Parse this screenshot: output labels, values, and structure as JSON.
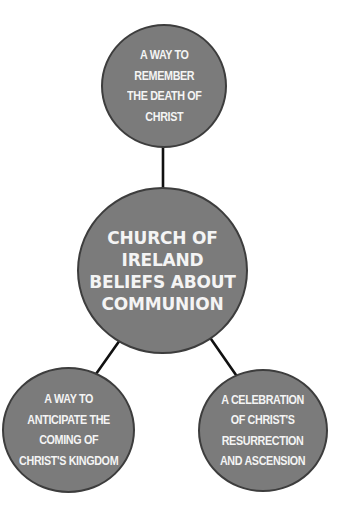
{
  "diagram": {
    "type": "spider-diagram",
    "colors": {
      "node_fill": "#7b7b7b",
      "node_border": "#3d3d3d",
      "node_text": "#f4f4f4",
      "connector": "#111111",
      "background": "#ffffff"
    },
    "center": {
      "label": "CHURCH OF\nIRELAND\nBELIEFS ABOUT\nCOMMUNION"
    },
    "nodes": [
      {
        "position": "top",
        "label": "A WAY TO\nREMEMBER\nTHE DEATH OF\nCHRIST"
      },
      {
        "position": "bottom-left",
        "label": "A WAY TO\nANTICIPATE THE\nCOMING OF\nCHRIST'S KINGDOM"
      },
      {
        "position": "bottom-right",
        "label": "A CELEBRATION\nOF CHRIST'S\nRESURRECTION\nAND ASCENSION"
      }
    ]
  }
}
